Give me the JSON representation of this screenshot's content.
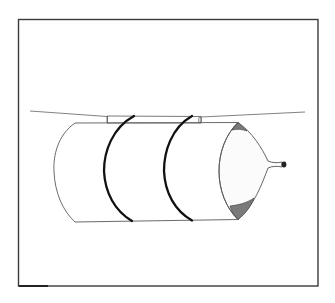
{
  "figure": {
    "title": "Balloon rocket on a string",
    "components": [
      {
        "id": "frame",
        "label": "border frame"
      },
      {
        "id": "string",
        "label": "string"
      },
      {
        "id": "straw",
        "label": "straw"
      },
      {
        "id": "tube",
        "label": "cylindrical tube"
      },
      {
        "id": "band-1",
        "label": "rubber band"
      },
      {
        "id": "band-2",
        "label": "rubber band"
      },
      {
        "id": "balloon",
        "label": "balloon"
      },
      {
        "id": "balloon-knot",
        "label": "balloon nozzle"
      }
    ]
  },
  "colors": {
    "background": "#ffffff",
    "line": "#4a4a4a",
    "band": "#111111",
    "shade": "#7a7a7a"
  }
}
